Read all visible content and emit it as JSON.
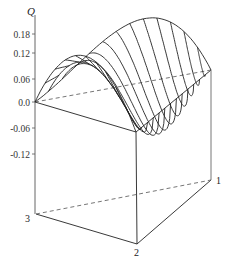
{
  "chart_data": {
    "type": "surface-3d",
    "title": "",
    "zlabel": "Q",
    "z_ticks": [
      "0.18",
      "0.12",
      "0.06",
      "0.0",
      "-0.06",
      "-0.12"
    ],
    "z_tick_values": [
      0.18,
      0.12,
      0.06,
      0.0,
      -0.06,
      -0.12
    ],
    "zlim": [
      -0.28,
      0.22
    ],
    "base": "ternary triangle (triangular prism)",
    "vertex_labels": [
      "1",
      "2",
      "3"
    ],
    "edges": {
      "3-2": "front-left edge, surface rises to max approx 0.16",
      "3-1": "back edge (dashed base), surface hump approx 0.16",
      "2-1": "right-front edge, Q = 0"
    },
    "min_value_approx": -0.12,
    "max_value_approx": 0.16,
    "num_cross_section_curves": 13,
    "grid": false,
    "legend": "none"
  },
  "labels": {
    "q_axis": "Q",
    "ticks": [
      {
        "text": "0.18",
        "y": 34
      },
      {
        "text": "0.12",
        "y": 53
      },
      {
        "text": "0.06",
        "y": 79
      },
      {
        "text": "0.0",
        "y": 102
      },
      {
        "text": "-0.06",
        "y": 128
      },
      {
        "text": "-0.12",
        "y": 154
      }
    ],
    "vertex_1": "1",
    "vertex_2": "2",
    "vertex_3": "3"
  },
  "colors": {
    "line": "#222222",
    "axis": "#555555",
    "dashed": "#666666"
  }
}
